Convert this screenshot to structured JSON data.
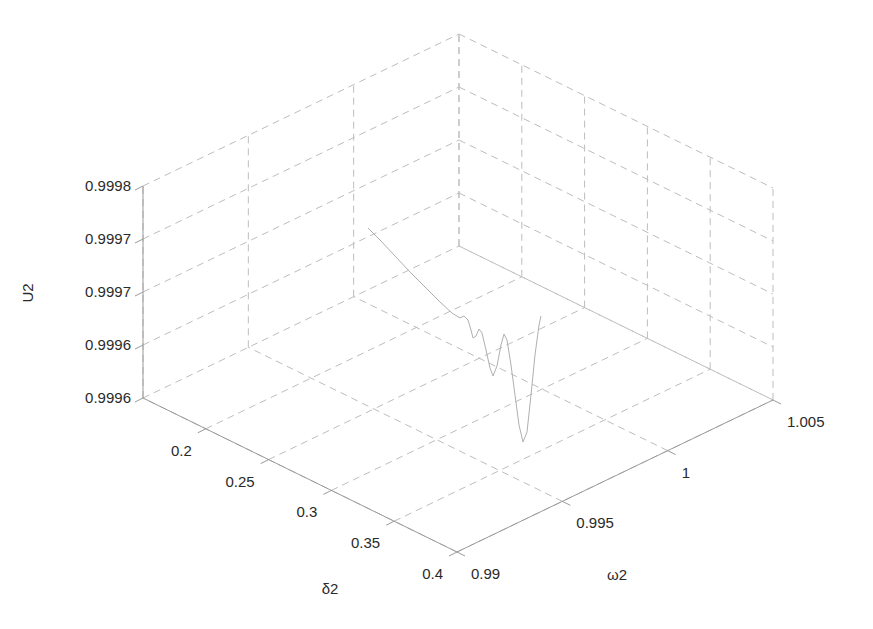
{
  "chart_data": {
    "type": "line",
    "subtype": "3d-line",
    "title": "",
    "xlabel": "δ2",
    "ylabel": "ω2",
    "zlabel": "U2",
    "x_ticks": [
      "0.2",
      "0.25",
      "0.3",
      "0.35",
      "0.4"
    ],
    "y_ticks": [
      "0.99",
      "0.995",
      "1",
      "1.005"
    ],
    "z_ticks": [
      "0.9996",
      "0.9996",
      "0.9997",
      "0.9997",
      "0.9998"
    ],
    "xlim": [
      0.15,
      0.4
    ],
    "ylim": [
      0.99,
      1.005
    ],
    "zlim": [
      0.99955,
      0.99978
    ],
    "grid": true,
    "series": [
      {
        "name": "U2 trajectory",
        "color": "#b0b0b0",
        "points_screen": [
          [
            368,
            228
          ],
          [
            380,
            240
          ],
          [
            395,
            256
          ],
          [
            410,
            272
          ],
          [
            425,
            287
          ],
          [
            440,
            302
          ],
          [
            452,
            313
          ],
          [
            460,
            318
          ],
          [
            464,
            316
          ],
          [
            468,
            320
          ],
          [
            471,
            330
          ],
          [
            473,
            338
          ],
          [
            476,
            336
          ],
          [
            479,
            329
          ],
          [
            482,
            333
          ],
          [
            486,
            350
          ],
          [
            490,
            368
          ],
          [
            493,
            376
          ],
          [
            497,
            366
          ],
          [
            501,
            345
          ],
          [
            504,
            334
          ],
          [
            507,
            340
          ],
          [
            511,
            365
          ],
          [
            515,
            395
          ],
          [
            519,
            425
          ],
          [
            523,
            442
          ],
          [
            527,
            432
          ],
          [
            531,
            395
          ],
          [
            535,
            355
          ],
          [
            539,
            325
          ],
          [
            541,
            316
          ]
        ]
      }
    ]
  },
  "axes": {
    "z_label": "U2",
    "x_label": "δ2",
    "y_label": "ω2"
  }
}
